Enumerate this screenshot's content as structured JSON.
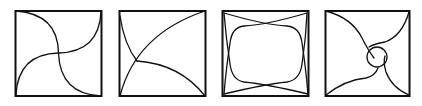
{
  "figure": {
    "panel_count": 4,
    "colors": {
      "stroke": "#111111",
      "background": "#ffffff"
    },
    "panels": [
      {
        "index": 1,
        "description": "square with four quarter-arc curves meeting at the center (pinwheel)"
      },
      {
        "index": 2,
        "description": "square with three arcs from corners meeting at an interior point left of center"
      },
      {
        "index": 3,
        "description": "square with four crossing curves forming a rounded central region"
      },
      {
        "index": 4,
        "description": "square with four S-curves from corners spiraling around a small central loop"
      }
    ]
  }
}
